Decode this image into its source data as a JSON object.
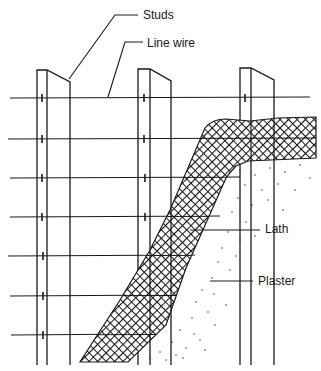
{
  "figure": {
    "labels": {
      "studs": "Studs",
      "line_wire": "Line wire",
      "lath": "Lath",
      "plaster": "Plaster"
    }
  },
  "components": [
    {
      "id": "studs",
      "label": "Studs",
      "count": 3
    },
    {
      "id": "line_wire",
      "label": "Line wire",
      "count": 7
    },
    {
      "id": "lath",
      "label": "Lath",
      "pattern": "diamond mesh"
    },
    {
      "id": "plaster",
      "label": "Plaster",
      "pattern": "stipple"
    }
  ],
  "colors": {
    "ink": "#1a1a1a",
    "background": "#ffffff"
  }
}
